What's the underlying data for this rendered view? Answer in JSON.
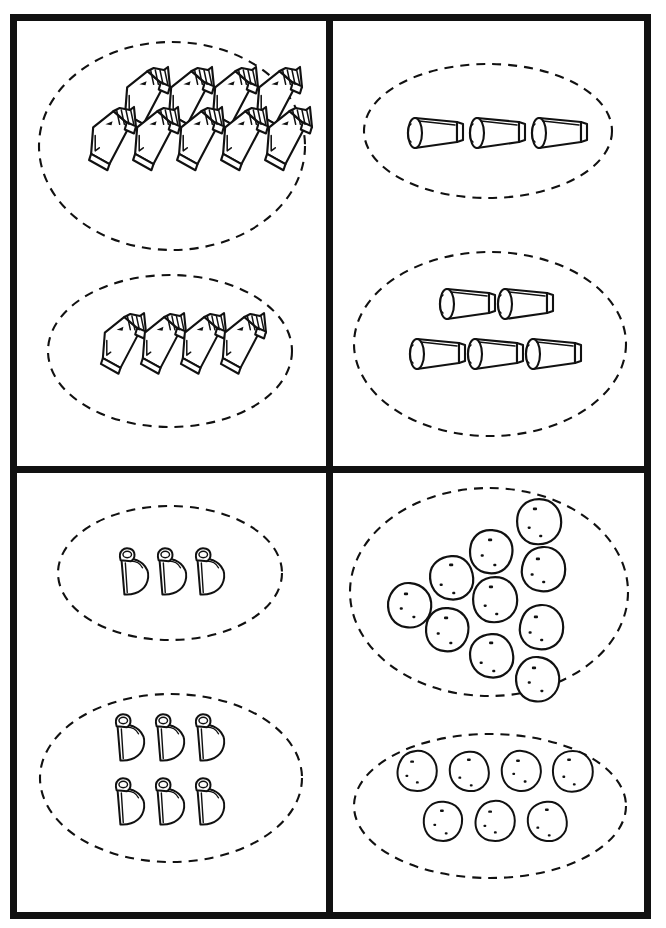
{
  "worksheet": {
    "title": "Counting Groups Worksheet",
    "description": "Four framed panels, each containing two dashed ovals with sets of objects to count.",
    "frame_color": "#111111",
    "background_color": "#ffffff",
    "oval_style": "dashed"
  },
  "panels": [
    {
      "id": "top-left",
      "position": "top-left",
      "object_name": "book",
      "object_icon": "book-icon",
      "groups": [
        {
          "id": "tl-upper",
          "count": 9,
          "rows": [
            4,
            5
          ],
          "label": "9 books"
        },
        {
          "id": "tl-lower",
          "count": 4,
          "rows": [
            4
          ],
          "label": "4 books"
        }
      ]
    },
    {
      "id": "top-right",
      "position": "top-right",
      "object_name": "cup",
      "object_icon": "cup-icon",
      "groups": [
        {
          "id": "tr-upper",
          "count": 3,
          "rows": [
            3
          ],
          "label": "3 cups"
        },
        {
          "id": "tr-lower",
          "count": 5,
          "rows": [
            2,
            3
          ],
          "label": "5 cups"
        }
      ]
    },
    {
      "id": "bottom-left",
      "position": "bottom-left",
      "object_name": "purse",
      "object_icon": "purse-icon",
      "groups": [
        {
          "id": "bl-upper",
          "count": 3,
          "rows": [
            3
          ],
          "label": "3 purses"
        },
        {
          "id": "bl-lower",
          "count": 6,
          "rows": [
            3,
            3
          ],
          "label": "6 purses"
        }
      ]
    },
    {
      "id": "bottom-right",
      "position": "bottom-right",
      "object_name": "potato",
      "object_icon": "potato-icon",
      "groups": [
        {
          "id": "br-upper",
          "count": 10,
          "rows": [
            1,
            2,
            3,
            2,
            2
          ],
          "label": "10 potatoes"
        },
        {
          "id": "br-lower",
          "count": 7,
          "rows": [
            4,
            3
          ],
          "label": "7 potatoes"
        }
      ]
    }
  ]
}
